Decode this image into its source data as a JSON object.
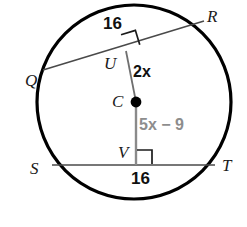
{
  "figure": {
    "shape": "circle",
    "colors": {
      "stroke_circle": "#000000",
      "stroke_chord": "#4a4a4a",
      "stroke_radius": "#7a7a7a",
      "label_black": "#111111",
      "label_gray": "#8d8d8d",
      "background": "#ffffff"
    }
  },
  "points": {
    "Q": {
      "label": "Q",
      "x": 25,
      "y": 72
    },
    "R": {
      "label": "R",
      "x": 207,
      "y": 8
    },
    "S": {
      "label": "S",
      "x": 30,
      "y": 160
    },
    "T": {
      "label": "T",
      "x": 222,
      "y": 157
    },
    "U": {
      "label": "U",
      "x": 104,
      "y": 55
    },
    "V": {
      "label": "V",
      "x": 118,
      "y": 144
    },
    "C": {
      "label": "C",
      "x": 112,
      "y": 93
    }
  },
  "measures": {
    "chord_qr_length": {
      "text": "16",
      "x": 103,
      "y": 15
    },
    "chord_st_length": {
      "text": "16",
      "x": 131,
      "y": 170
    },
    "radius_cu_expr": {
      "text": "2x",
      "number": "2",
      "variable": "x",
      "x": 133,
      "y": 64
    },
    "radius_cv_expr": {
      "text": "5x − 9",
      "number": "5",
      "variable": "x",
      "suffix": " − 9",
      "x": 139,
      "y": 117
    }
  },
  "geometry": {
    "circle": {
      "cx": 134,
      "cy": 102,
      "r": 97
    },
    "chord_qr": {
      "x1": 43,
      "y1": 70,
      "x2": 204,
      "y2": 21
    },
    "chord_st": {
      "x1": 52,
      "y1": 165,
      "x2": 215,
      "y2": 165
    },
    "radius_cu": {
      "x1": 136,
      "y1": 102,
      "x2": 126,
      "y2": 51
    },
    "radius_cv": {
      "x1": 136,
      "y1": 102,
      "x2": 136,
      "y2": 165
    },
    "center_dot": {
      "cx": 136,
      "cy": 102,
      "r": 5
    },
    "right_angle_u": "square marker at U between chord QR and radius CU",
    "right_angle_v": "square marker at V between chord ST and radius CV"
  }
}
